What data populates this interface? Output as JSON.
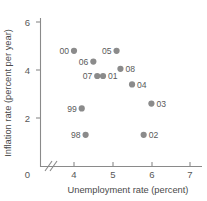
{
  "chart_data": {
    "type": "scatter",
    "title": "",
    "xlabel": "Unemployment rate (percent)",
    "ylabel": "Inflation rate (percent per year)",
    "xlim": [
      3.5,
      7.4
    ],
    "ylim": [
      0,
      6.4
    ],
    "xticks": [
      0,
      4,
      5,
      6,
      7
    ],
    "xticklabels": [
      "0",
      "4",
      "5",
      "6",
      "7"
    ],
    "yticks": [
      0,
      2,
      4,
      6
    ],
    "yticklabels": [
      "0",
      "2",
      "4",
      "6"
    ],
    "x_axis_break": true,
    "grid": false,
    "legend": false,
    "marker": "filled-circle",
    "marker_color": "#8b8b8b",
    "points": [
      {
        "label": "00",
        "x": 4.0,
        "y": 4.8,
        "label_side": "left"
      },
      {
        "label": "05",
        "x": 5.1,
        "y": 4.8,
        "label_side": "left"
      },
      {
        "label": "06",
        "x": 4.5,
        "y": 4.35,
        "label_side": "left"
      },
      {
        "label": "08",
        "x": 5.2,
        "y": 4.05,
        "label_side": "right"
      },
      {
        "label": "07",
        "x": 4.6,
        "y": 3.75,
        "label_side": "left"
      },
      {
        "label": "01",
        "x": 4.75,
        "y": 3.75,
        "label_side": "right"
      },
      {
        "label": "04",
        "x": 5.5,
        "y": 3.4,
        "label_side": "right"
      },
      {
        "label": "03",
        "x": 6.0,
        "y": 2.6,
        "label_side": "right"
      },
      {
        "label": "99",
        "x": 4.2,
        "y": 2.4,
        "label_side": "left"
      },
      {
        "label": "98",
        "x": 4.3,
        "y": 1.3,
        "label_side": "left"
      },
      {
        "label": "02",
        "x": 5.8,
        "y": 1.3,
        "label_side": "right"
      }
    ]
  },
  "axes": {
    "x_title": "Unemployment rate (percent)",
    "y_title": "Inflation rate (percent per year)"
  }
}
